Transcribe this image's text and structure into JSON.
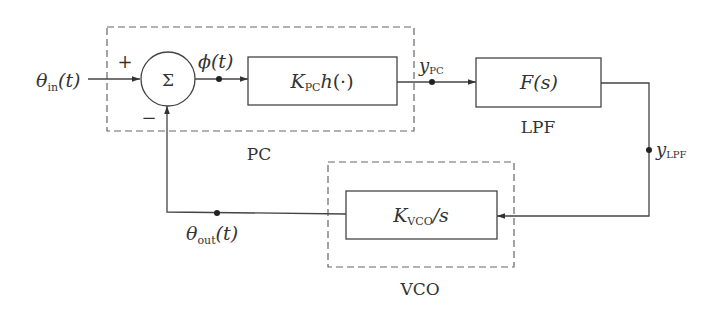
{
  "diagram": {
    "type": "pll-block-diagram",
    "colors": {
      "line": "#444444",
      "dash": "#666666",
      "text": "#333333",
      "background": "#ffffff"
    },
    "input": {
      "symbol": "θ",
      "subscript": "in",
      "arg": "(t)"
    },
    "summing_junction": {
      "symbol": "Σ",
      "plus": "+",
      "minus": "−"
    },
    "error_signal": {
      "symbol": "ϕ",
      "arg": "(t)"
    },
    "pc_block": {
      "k": "K",
      "k_sub": "PC",
      "func": "h",
      "arg": "(·)"
    },
    "pc_group_label": "PC",
    "pc_output": {
      "symbol": "y",
      "subscript": "PC"
    },
    "lpf_block": {
      "func": "F",
      "arg": "(s)"
    },
    "lpf_label": "LPF",
    "lpf_output": {
      "symbol": "y",
      "subscript": "LPF"
    },
    "vco_block": {
      "k": "K",
      "k_sub": "VCO",
      "tail": "/s"
    },
    "vco_group_label": "VCO",
    "output": {
      "symbol": "θ",
      "subscript": "out",
      "arg": "(t)"
    }
  }
}
